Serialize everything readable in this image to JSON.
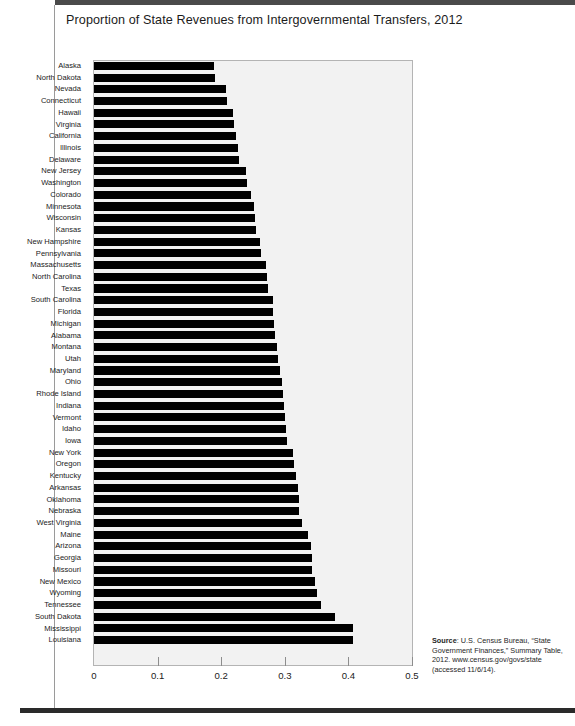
{
  "page": {
    "title": "Proportion of State Revenues from Intergovernmental Transfers, 2012"
  },
  "source": {
    "label": "Source",
    "text": ": U.S. Census Bureau, “State Government Finances,” Summary Table, 2012. www.census.gov/govs/state (accessed 11/6/14)."
  },
  "chart_data": {
    "type": "bar",
    "orientation": "horizontal",
    "title": "Proportion of State Revenues from Intergovernmental Transfers, 2012",
    "xlabel": "",
    "ylabel": "",
    "xlim": [
      0,
      0.5
    ],
    "xticks": [
      0,
      0.1,
      0.2,
      0.3,
      0.4,
      0.5
    ],
    "xticklabels": [
      "0",
      "0.1",
      "0.2",
      "0.3",
      "0.4",
      "0.5"
    ],
    "grid": false,
    "legend": null,
    "bar_color": "#000000",
    "plot_background": "#f2f2f2",
    "categories": [
      "Alaska",
      "North Dakota",
      "Nevada",
      "Connecticut",
      "Hawaii",
      "Virginia",
      "California",
      "Illinois",
      "Delaware",
      "New Jersey",
      "Washington",
      "Colorado",
      "Minnesota",
      "Wisconsin",
      "Kansas",
      "New Hampshire",
      "Pennsylvania",
      "Massachusetts",
      "North Carolina",
      "Texas",
      "South Carolina",
      "Florida",
      "Michigan",
      "Alabama",
      "Montana",
      "Utah",
      "Maryland",
      "Ohio",
      "Rhode Island",
      "Indiana",
      "Vermont",
      "Idaho",
      "Iowa",
      "New York",
      "Oregon",
      "Kentucky",
      "Arkansas",
      "Oklahoma",
      "Nebraska",
      "West Virginia",
      "Maine",
      "Arizona",
      "Georgia",
      "Missouri",
      "New Mexico",
      "Wyoming",
      "Tennessee",
      "South Dakota",
      "Mississippi",
      "Louisiana"
    ],
    "values": [
      0.189,
      0.19,
      0.208,
      0.209,
      0.219,
      0.22,
      0.224,
      0.226,
      0.228,
      0.239,
      0.24,
      0.247,
      0.252,
      0.253,
      0.254,
      0.261,
      0.263,
      0.271,
      0.272,
      0.274,
      0.281,
      0.282,
      0.283,
      0.285,
      0.287,
      0.29,
      0.292,
      0.296,
      0.297,
      0.298,
      0.301,
      0.302,
      0.303,
      0.313,
      0.314,
      0.318,
      0.321,
      0.322,
      0.323,
      0.327,
      0.337,
      0.341,
      0.342,
      0.343,
      0.348,
      0.35,
      0.357,
      0.379,
      0.407,
      0.408
    ]
  }
}
